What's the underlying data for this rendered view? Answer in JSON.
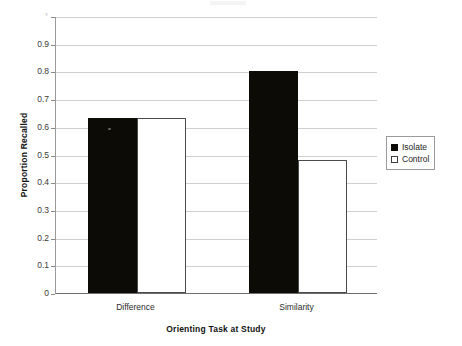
{
  "chart_data": {
    "type": "bar",
    "title": "",
    "xlabel": "Orienting Task at Study",
    "ylabel": "Proportion Recalled",
    "categories": [
      "Difference",
      "Similarity"
    ],
    "series": [
      {
        "name": "Isolate",
        "values": [
          0.63,
          0.8
        ],
        "color": "#0d0b06",
        "fill": "solid"
      },
      {
        "name": "Control",
        "values": [
          0.63,
          0.48
        ],
        "color": "#ffffff",
        "fill": "outline"
      }
    ],
    "ylim": [
      0,
      1
    ],
    "ytick_labels": [
      "1",
      "0.9",
      "0.8",
      "0.7",
      "0.6",
      "0.5",
      "0.4",
      "0.3",
      "0.2",
      "0.1",
      "0"
    ],
    "ytick_values": [
      1,
      0.9,
      0.8,
      0.7,
      0.6,
      0.5,
      0.4,
      0.3,
      0.2,
      0.1,
      0
    ],
    "grid": true,
    "legend_position": "right",
    "legend_entries": [
      "Isolate",
      "Control"
    ]
  },
  "axes": {
    "y_title": "Proportion Recalled",
    "x_title": "Orienting Task at Study",
    "yticks": [
      {
        "label": "1",
        "value": 1.0
      },
      {
        "label": "0.9",
        "value": 0.9
      },
      {
        "label": "0.8",
        "value": 0.8
      },
      {
        "label": "0.7",
        "value": 0.7
      },
      {
        "label": "0.6",
        "value": 0.6
      },
      {
        "label": "0.5",
        "value": 0.5
      },
      {
        "label": "0.4",
        "value": 0.4
      },
      {
        "label": "0.3",
        "value": 0.3
      },
      {
        "label": "0.2",
        "value": 0.2
      },
      {
        "label": "0.1",
        "value": 0.1
      },
      {
        "label": "0",
        "value": 0.0
      }
    ],
    "categories": [
      {
        "label": "Difference"
      },
      {
        "label": "Similarity"
      }
    ]
  },
  "legend": {
    "items": [
      {
        "label": "Isolate",
        "swatch": "filled-black-square"
      },
      {
        "label": "Control",
        "swatch": "outlined-white-square"
      }
    ]
  },
  "bars": [
    {
      "group": "Difference",
      "series": "Isolate",
      "value": 0.63
    },
    {
      "group": "Difference",
      "series": "Control",
      "value": 0.63
    },
    {
      "group": "Similarity",
      "series": "Isolate",
      "value": 0.8
    },
    {
      "group": "Similarity",
      "series": "Control",
      "value": 0.48
    }
  ],
  "colors": {
    "isolate": "#0d0b06",
    "control": "#ffffff",
    "control_outline": "#4a4a4a",
    "gridline": "#cfcfcf",
    "axis": "#6e6e6e",
    "background": "#ffffff"
  }
}
